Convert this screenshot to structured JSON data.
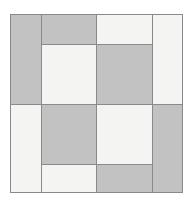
{
  "canvas": {
    "width": 192,
    "height": 202,
    "background_color": "#ffffff"
  },
  "figure": {
    "name": "basketweave-quilt-pattern",
    "frame": {
      "x": 10,
      "y": 14,
      "width": 172,
      "height": 178
    },
    "colors": {
      "gray_fill": "#c2c2c2",
      "light_fill": "#f4f4f2",
      "line_color": "#8a8a8a",
      "border_color": "#8a8a8a"
    },
    "line_width": 1,
    "grid": {
      "x_edges": [
        10,
        41,
        96,
        152,
        182
      ],
      "y_edges": [
        14,
        44,
        104,
        164,
        192
      ]
    },
    "columns": [
      {
        "index": 0,
        "name": "column-1",
        "x": 10,
        "width": 31,
        "cells": [
          {
            "name": "cell-c1-r1",
            "y": 14,
            "height": 90,
            "fill": "gray"
          },
          {
            "name": "cell-c1-r2",
            "y": 104,
            "height": 88,
            "fill": "light"
          }
        ]
      },
      {
        "index": 1,
        "name": "column-2",
        "x": 41,
        "width": 55,
        "cells": [
          {
            "name": "cell-c2-r1",
            "y": 14,
            "height": 30,
            "fill": "gray"
          },
          {
            "name": "cell-c2-r2",
            "y": 44,
            "height": 60,
            "fill": "light"
          },
          {
            "name": "cell-c2-r3",
            "y": 104,
            "height": 60,
            "fill": "gray"
          },
          {
            "name": "cell-c2-r4",
            "y": 164,
            "height": 28,
            "fill": "light"
          }
        ]
      },
      {
        "index": 2,
        "name": "column-3",
        "x": 96,
        "width": 56,
        "cells": [
          {
            "name": "cell-c3-r1",
            "y": 14,
            "height": 30,
            "fill": "light"
          },
          {
            "name": "cell-c3-r2",
            "y": 44,
            "height": 60,
            "fill": "gray"
          },
          {
            "name": "cell-c3-r3",
            "y": 104,
            "height": 60,
            "fill": "light"
          },
          {
            "name": "cell-c3-r4",
            "y": 164,
            "height": 28,
            "fill": "gray"
          }
        ]
      },
      {
        "index": 3,
        "name": "column-4",
        "x": 152,
        "width": 30,
        "cells": [
          {
            "name": "cell-c4-r1",
            "y": 14,
            "height": 90,
            "fill": "light"
          },
          {
            "name": "cell-c4-r2",
            "y": 104,
            "height": 88,
            "fill": "gray"
          }
        ]
      }
    ]
  }
}
